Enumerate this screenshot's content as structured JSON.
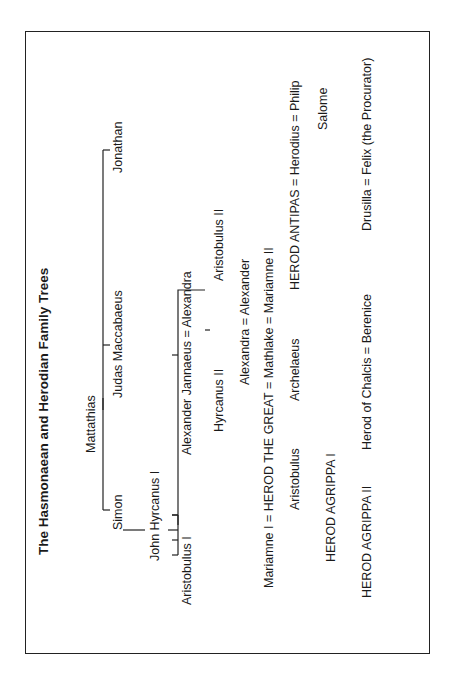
{
  "diagram": {
    "title": "The Hasmonaean and Herodian Family Trees",
    "people": {
      "mattathias": "Mattathias",
      "simon": "Simon",
      "judas": "Judas Maccabaeus",
      "jonathan": "Jonathan",
      "john_hyrcanus": "John Hyrcanus I",
      "aristobulus_i": "Aristobulus I",
      "alexander_jannaeus_couple": "Alexander Jannaeus = Alexandra",
      "hyrcanus_ii": "Hyrcanus II",
      "aristobulus_ii": "Aristobulus II",
      "alexandra_alexander": "Alexandra = Alexander",
      "herod_great_couple": "Mariamne I = HEROD THE GREAT = Mathlake = Mariamne II",
      "aristobulus": "Aristobulus",
      "archelaeus": "Archelaeus",
      "antipas_couple": "HEROD ANTIPAS = Herodius = Philip",
      "salome": "Salome",
      "agrippa_i": "HEROD AGRIPPA I",
      "agrippa_ii": "HEROD AGRIPPA II",
      "chalcis_couple": "Herod of Chalcis = Berenice",
      "drusilla_couple": "Drusilla = Felix (the Procurator)"
    }
  }
}
